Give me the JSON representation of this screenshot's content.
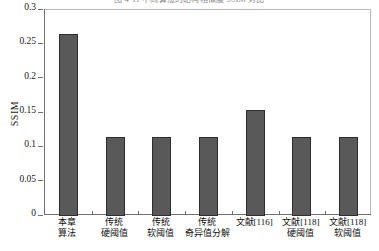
{
  "chart_data": {
    "type": "bar",
    "title": "图 4-11 不同算法的结构相似度 SSIM 对比",
    "title_visible": false,
    "xlabel": "",
    "ylabel": "SSIM",
    "ylim": [
      0,
      0.3
    ],
    "yticks": [
      "0",
      "0.05",
      "0.1",
      "0.15",
      "0.2",
      "0.25",
      "0.3"
    ],
    "ytick_values": [
      0,
      0.05,
      0.1,
      0.15,
      0.2,
      0.25,
      0.3
    ],
    "grid": false,
    "legend": null,
    "bar_color": "#595959",
    "bar_edge_color": "#2e2e2e",
    "categories": [
      "本章算法",
      "传统硬阈值",
      "传统软阈值",
      "传统奇异值分解",
      "文献[116]",
      "文献[118]硬阈值",
      "文献[118]软阈值"
    ],
    "category_lines": [
      [
        "本章",
        "算法"
      ],
      [
        "传统",
        "硬阈值"
      ],
      [
        "传统",
        "软阈值"
      ],
      [
        "传统",
        "奇异值分解"
      ],
      [
        "文献[116]",
        ""
      ],
      [
        "文献[118]",
        "硬阈值"
      ],
      [
        "文献[118]",
        "软阈值"
      ]
    ],
    "values": [
      0.265,
      0.115,
      0.115,
      0.115,
      0.154,
      0.115,
      0.115
    ]
  }
}
